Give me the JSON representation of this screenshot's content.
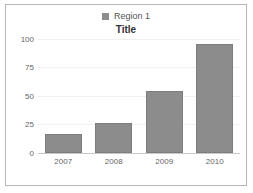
{
  "chart_data": {
    "type": "bar",
    "title": "Title",
    "xlabel": "",
    "ylabel": "",
    "categories": [
      "2007",
      "2008",
      "2009",
      "2010"
    ],
    "series": [
      {
        "name": "Region 1",
        "values": [
          17,
          26,
          54,
          96
        ],
        "color": "#8c8c8c"
      }
    ],
    "ylim": [
      0,
      100
    ],
    "yticks": [
      0,
      25,
      50,
      75,
      100
    ],
    "ytick_labels": [
      "0",
      "25",
      "50",
      "75",
      "100"
    ],
    "grid": true,
    "legend_position": "top-center",
    "colors": {
      "bar_fill": "#8c8c8c",
      "bar_border": "#7d7d7d",
      "gridline": "#f0f0f0",
      "axis": "#c9c9c9",
      "frame_border": "#b5b5b5",
      "tick_text": "#666666",
      "title_text": "#333333",
      "legend_text": "#555555",
      "background": "#ffffff"
    }
  }
}
